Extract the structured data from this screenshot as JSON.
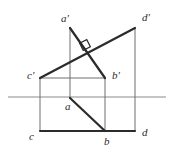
{
  "figure": {
    "type": "descriptive-geometry-diagram",
    "colors": {
      "thick_line": "#2b2b2b",
      "thin_line": "#6e6e6e",
      "axis_line": "#8a8a8a",
      "label_text": "#2b2b2b",
      "background": "#ffffff"
    },
    "axis": {
      "name": "ground-line",
      "x1": 8,
      "y1": 97,
      "x2": 166,
      "y2": 97
    },
    "points": [
      {
        "id": "a_front",
        "label": "a'",
        "x": 70,
        "y": 28,
        "label_x": 61,
        "label_y": 19
      },
      {
        "id": "d_front",
        "label": "d'",
        "x": 135,
        "y": 28,
        "label_x": 142,
        "label_y": 18
      },
      {
        "id": "c_front",
        "label": "c'",
        "x": 40,
        "y": 78,
        "label_x": 27,
        "label_y": 76
      },
      {
        "id": "b_front",
        "label": "b'",
        "x": 105,
        "y": 78,
        "label_x": 112,
        "label_y": 76
      },
      {
        "id": "a_top",
        "label": "a",
        "x": 70,
        "y": 98,
        "label_x": 65,
        "label_y": 107
      },
      {
        "id": "c_top",
        "label": "c",
        "x": 40,
        "y": 131,
        "label_x": 29,
        "label_y": 137
      },
      {
        "id": "b_top",
        "label": "b",
        "x": 105,
        "y": 131,
        "label_x": 104,
        "label_y": 142
      },
      {
        "id": "d_top",
        "label": "d",
        "x": 135,
        "y": 131,
        "label_x": 142,
        "label_y": 133
      }
    ],
    "thick_segments": [
      {
        "name": "segment-a-prime-b-prime",
        "x1": 70,
        "y1": 28,
        "x2": 105,
        "y2": 78
      },
      {
        "name": "segment-c-prime-d-prime",
        "x1": 40,
        "y1": 78,
        "x2": 135,
        "y2": 28
      },
      {
        "name": "segment-a-b-top",
        "x1": 70,
        "y1": 98,
        "x2": 105,
        "y2": 131
      },
      {
        "name": "segment-c-b-top",
        "x1": 40,
        "y1": 131,
        "x2": 105,
        "y2": 131
      },
      {
        "name": "segment-b-d-top",
        "x1": 105,
        "y1": 131,
        "x2": 135,
        "y2": 131
      }
    ],
    "thin_segments": [
      {
        "name": "projector-a-vertical",
        "x1": 70,
        "y1": 28,
        "x2": 70,
        "y2": 99
      },
      {
        "name": "projector-c-vertical",
        "x1": 40,
        "y1": 78,
        "x2": 40,
        "y2": 131
      },
      {
        "name": "projector-b-vertical",
        "x1": 105,
        "y1": 78,
        "x2": 105,
        "y2": 131
      },
      {
        "name": "projector-d-vertical",
        "x1": 135,
        "y1": 28,
        "x2": 135,
        "y2": 131
      },
      {
        "name": "connector-c-prime-b-prime",
        "x1": 40,
        "y1": 78,
        "x2": 105,
        "y2": 78
      }
    ],
    "right_angle_marker": {
      "name": "right-angle-square",
      "cx": 85,
      "cy": 45,
      "size": 8,
      "rotation": -27
    }
  }
}
